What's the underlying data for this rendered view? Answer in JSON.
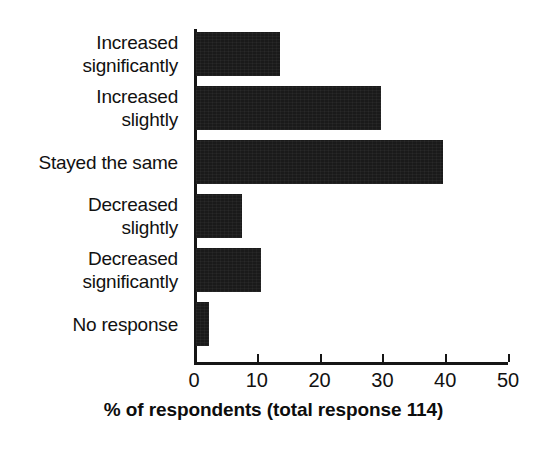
{
  "chart_data": {
    "type": "bar",
    "orientation": "horizontal",
    "title": "",
    "xlabel": "% of respondents (total response 114)",
    "ylabel": "",
    "categories": [
      "Increased significantly",
      "Increased slightly",
      "Stayed the same",
      "Decreased slightly",
      "Decreased significantly",
      "No response"
    ],
    "category_lines": [
      [
        "Increased",
        "significantly"
      ],
      [
        "Increased",
        "slightly"
      ],
      [
        "Stayed the same"
      ],
      [
        "Decreased",
        "slightly"
      ],
      [
        "Decreased",
        "significantly"
      ],
      [
        "No response"
      ]
    ],
    "values": [
      13.4,
      29.5,
      39.4,
      7.3,
      10.3,
      2.0
    ],
    "xlim": [
      0,
      50
    ],
    "xticks": [
      0,
      10,
      20,
      30,
      40,
      50
    ],
    "xtick_labels": [
      "0",
      "10",
      "20",
      "30",
      "40",
      "50"
    ],
    "grid": false,
    "legend": false,
    "bar_color": "#1a1a1a",
    "axis_color": "#161616",
    "background_color": "#ffffff",
    "total_response": 114
  }
}
